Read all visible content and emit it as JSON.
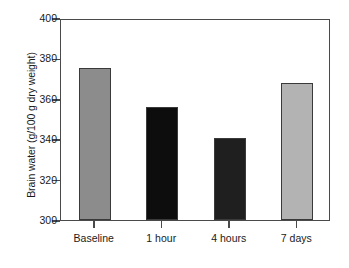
{
  "chart_data": {
    "type": "bar",
    "title": "",
    "xlabel": "",
    "ylabel": "Brain water (g/100 g dry weight)",
    "categories": [
      "Baseline",
      "1 hour",
      "4 hours",
      "7 days"
    ],
    "values": [
      375.5,
      356.0,
      340.5,
      368.0
    ],
    "ylim": [
      300,
      400
    ],
    "yticks": [
      300,
      320,
      340,
      360,
      380,
      400
    ],
    "ytick_labels": [
      "300",
      "320",
      "340",
      "360",
      "380",
      "400"
    ],
    "grid": false,
    "legend": false,
    "bar_colors": [
      "#8c8c8c",
      "#0d0d0d",
      "#1f1f1f",
      "#b3b3b3"
    ],
    "bar_edge_color": "#3a3a3a",
    "axis_color": "#4a4a4a",
    "background": "#ffffff"
  }
}
